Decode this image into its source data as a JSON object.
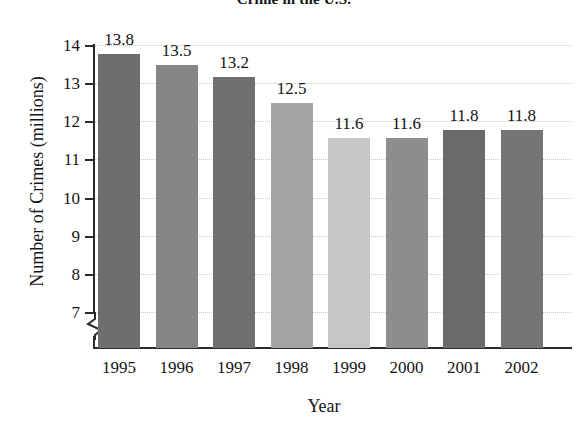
{
  "chart_data": {
    "type": "bar",
    "title": "Crime in the U.S.",
    "xlabel": "Year",
    "ylabel": "Number of Crimes (millions)",
    "categories": [
      "1995",
      "1996",
      "1997",
      "1998",
      "1999",
      "2000",
      "2001",
      "2002"
    ],
    "values": [
      13.8,
      13.5,
      13.2,
      12.5,
      11.6,
      11.6,
      11.8,
      11.8
    ],
    "value_labels": [
      "13.8",
      "13.5",
      "13.2",
      "12.5",
      "11.6",
      "11.6",
      "11.8",
      "11.8"
    ],
    "ylim": [
      7,
      14
    ],
    "ytick_labels": [
      "14",
      "13",
      "12",
      "11",
      "10",
      "9",
      "8",
      "7"
    ],
    "ytick_values": [
      14,
      13,
      12,
      11,
      10,
      9,
      8,
      7
    ],
    "grid": "horizontal-dotted",
    "legend": "none",
    "axis_break": "y-axis truncated below 7",
    "bar_colors": [
      "#6e6e6e",
      "#858585",
      "#707070",
      "#a3a3a3",
      "#c6c6c6",
      "#8d8d8d",
      "#6a6a6a",
      "#757575"
    ]
  },
  "colors": {
    "axis": "#2b2b2b",
    "grid": "#c9c9c9",
    "text": "#161616"
  }
}
